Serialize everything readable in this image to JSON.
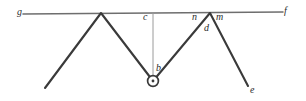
{
  "figure": {
    "canvas": {
      "width": 306,
      "height": 101,
      "background": "#ffffff"
    },
    "colors": {
      "stroke_dark": "#3a3a3a",
      "stroke_baseline": "#6e6e6e",
      "stroke_thin": "#8c8c8c",
      "label_color": "#2b2b2b"
    },
    "labels": [
      {
        "id": "g",
        "text": "g",
        "x": 17,
        "y": 7
      },
      {
        "id": "f",
        "text": "f",
        "x": 284,
        "y": 6
      },
      {
        "id": "c",
        "text": "c",
        "x": 143,
        "y": 12
      },
      {
        "id": "n",
        "text": "n",
        "x": 192,
        "y": 12
      },
      {
        "id": "m",
        "text": "m",
        "x": 216,
        "y": 12
      },
      {
        "id": "d",
        "text": "d",
        "x": 204,
        "y": 23
      },
      {
        "id": "b",
        "text": "b",
        "x": 156,
        "y": 63
      },
      {
        "id": "e",
        "text": "e",
        "x": 250,
        "y": 85
      }
    ],
    "baseline": {
      "x1": 23,
      "y1": 14,
      "x2": 283,
      "y2": 12
    },
    "zigzag": [
      {
        "x": 45,
        "y": 88
      },
      {
        "x": 101,
        "y": 13
      },
      {
        "x": 153,
        "y": 81
      },
      {
        "x": 210,
        "y": 13
      },
      {
        "x": 248,
        "y": 86
      }
    ],
    "plumb_line": {
      "x1": 153,
      "y1": 13,
      "x2": 153,
      "y2": 77
    },
    "bob": {
      "cx": 153,
      "cy": 81,
      "r_outer": 5.4,
      "r_inner": 1.4
    }
  }
}
